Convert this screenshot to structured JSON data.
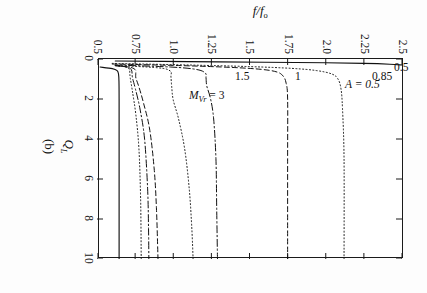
{
  "chart_data": {
    "type": "line",
    "title": "",
    "panel_label": "(b)",
    "xlabel": "Q_L",
    "ylabel": "f/f_o",
    "xlim": [
      0,
      10
    ],
    "ylim": [
      0.5,
      2.5
    ],
    "xticks": [
      0,
      2,
      4,
      6,
      8,
      10
    ],
    "xtick_labels": [
      "0",
      "2",
      "4",
      "6",
      "8",
      "10"
    ],
    "yticks": [
      0.5,
      0.75,
      1.0,
      1.25,
      1.5,
      1.75,
      2.0,
      2.25,
      2.5
    ],
    "ytick_labels": [
      "0.5",
      "0.75",
      "1.0",
      "1.25",
      "1.5",
      "1.75",
      "2.0",
      "2.25",
      "2.5"
    ],
    "grid": false,
    "legend_position": "inline-curve-labels",
    "annotations": [
      {
        "text": "A = 0.5",
        "kind": "parameter",
        "x": 1.0,
        "y": 2.12
      },
      {
        "text": "0.5",
        "kind": "curve-label-corner",
        "x": 0.15,
        "y": 2.44
      },
      {
        "text": "0.85",
        "kind": "curve-label",
        "x": 0.62,
        "y": 2.3
      },
      {
        "text": "1",
        "kind": "curve-label",
        "x": 0.62,
        "y": 1.79
      },
      {
        "text": "1.5",
        "kind": "curve-label",
        "x": 0.62,
        "y": 1.4
      },
      {
        "text": "M_Vr = 3",
        "kind": "curve-label",
        "x": 1.55,
        "y": 1.1
      }
    ],
    "series": [
      {
        "name": "M_Vr = 0.5",
        "label": "0.5",
        "style": "solid",
        "asymptote_y": 2.5,
        "knee_x": 0.28,
        "comment": "rises off scale at top-left corner",
        "points": [
          [
            0.1,
            0.62
          ],
          [
            0.13,
            1.1
          ],
          [
            0.16,
            1.6
          ],
          [
            0.19,
            2.0
          ],
          [
            0.22,
            2.25
          ],
          [
            0.26,
            2.42
          ],
          [
            0.3,
            2.5
          ]
        ]
      },
      {
        "name": "M_Vr = 0.85",
        "label": "0.85",
        "style": "dotted",
        "asymptote_y": 2.12,
        "knee_x": 0.55,
        "points": [
          [
            0.22,
            0.6
          ],
          [
            0.3,
            1.1
          ],
          [
            0.38,
            1.5
          ],
          [
            0.47,
            1.78
          ],
          [
            0.58,
            1.94
          ],
          [
            0.75,
            2.04
          ],
          [
            1.0,
            2.08
          ],
          [
            1.5,
            2.1
          ],
          [
            2.5,
            2.11
          ],
          [
            5.0,
            2.12
          ],
          [
            10.0,
            2.12
          ]
        ]
      },
      {
        "name": "M_Vr = 1",
        "label": "1",
        "style": "dashed",
        "asymptote_y": 1.75,
        "knee_x": 0.5,
        "points": [
          [
            0.25,
            0.6
          ],
          [
            0.33,
            1.05
          ],
          [
            0.42,
            1.38
          ],
          [
            0.52,
            1.58
          ],
          [
            0.65,
            1.68
          ],
          [
            0.85,
            1.72
          ],
          [
            1.2,
            1.74
          ],
          [
            2.0,
            1.75
          ],
          [
            5.0,
            1.75
          ],
          [
            10.0,
            1.75
          ]
        ]
      },
      {
        "name": "M_Vr = 1.5",
        "label": "1.5",
        "style": "dashdot",
        "asymptote_y": 1.29,
        "minimum_y": 1.2,
        "minimum_x": 1.35,
        "knee_x": 0.45,
        "points": [
          [
            0.3,
            0.62
          ],
          [
            0.4,
            0.98
          ],
          [
            0.52,
            1.15
          ],
          [
            0.7,
            1.21
          ],
          [
            0.95,
            1.215
          ],
          [
            1.35,
            1.22
          ],
          [
            2.0,
            1.245
          ],
          [
            3.0,
            1.265
          ],
          [
            5.0,
            1.28
          ],
          [
            7.5,
            1.285
          ],
          [
            10.0,
            1.29
          ]
        ]
      },
      {
        "name": "M_Vr = 2",
        "label": "",
        "style": "dotted",
        "asymptote_y": 1.13,
        "minimum_y": 0.99,
        "minimum_x": 2.05,
        "knee_x": 0.42,
        "points": [
          [
            0.32,
            0.62
          ],
          [
            0.44,
            0.9
          ],
          [
            0.6,
            0.98
          ],
          [
            0.9,
            0.985
          ],
          [
            1.4,
            0.99
          ],
          [
            2.05,
            1.0
          ],
          [
            3.0,
            1.035
          ],
          [
            4.5,
            1.075
          ],
          [
            6.5,
            1.105
          ],
          [
            8.5,
            1.122
          ],
          [
            10.0,
            1.13
          ]
        ]
      },
      {
        "name": "M_Vr = 3",
        "label": "M_Vr = 3",
        "style": "dashed",
        "asymptote_y": 0.9,
        "minimum_y": 0.755,
        "minimum_x": 0.95,
        "knee_x": 0.4,
        "points": [
          [
            0.33,
            0.62
          ],
          [
            0.42,
            0.72
          ],
          [
            0.55,
            0.752
          ],
          [
            0.75,
            0.754
          ],
          [
            0.95,
            0.755
          ],
          [
            1.4,
            0.775
          ],
          [
            2.2,
            0.805
          ],
          [
            3.5,
            0.845
          ],
          [
            5.5,
            0.875
          ],
          [
            7.5,
            0.89
          ],
          [
            10.0,
            0.9
          ]
        ]
      },
      {
        "name": "M_Vr = 4",
        "label": "",
        "style": "dashdot",
        "asymptote_y": 0.84,
        "minimum_y": 0.73,
        "minimum_x": 0.85,
        "knee_x": 0.38,
        "points": [
          [
            0.33,
            0.62
          ],
          [
            0.41,
            0.7
          ],
          [
            0.53,
            0.725
          ],
          [
            0.72,
            0.73
          ],
          [
            0.95,
            0.733
          ],
          [
            1.5,
            0.752
          ],
          [
            2.5,
            0.782
          ],
          [
            4.0,
            0.812
          ],
          [
            6.5,
            0.832
          ],
          [
            8.5,
            0.838
          ],
          [
            10.0,
            0.84
          ]
        ]
      },
      {
        "name": "M_Vr = 6",
        "label": "",
        "style": "dotted",
        "asymptote_y": 0.79,
        "minimum_y": 0.715,
        "minimum_x": 0.8,
        "knee_x": 0.36,
        "points": [
          [
            0.33,
            0.62
          ],
          [
            0.4,
            0.69
          ],
          [
            0.52,
            0.712
          ],
          [
            0.7,
            0.715
          ],
          [
            0.95,
            0.718
          ],
          [
            1.6,
            0.732
          ],
          [
            2.8,
            0.755
          ],
          [
            4.5,
            0.775
          ],
          [
            7.0,
            0.786
          ],
          [
            10.0,
            0.79
          ]
        ]
      },
      {
        "name": "M_Vr = large",
        "label": "",
        "style": "solid",
        "asymptote_y": 0.645,
        "knee_x": 0.52,
        "comment": "outermost solid boundary curve",
        "points": [
          [
            0.4,
            0.52
          ],
          [
            0.48,
            0.6
          ],
          [
            0.58,
            0.632
          ],
          [
            0.75,
            0.641
          ],
          [
            1.1,
            0.644
          ],
          [
            2.0,
            0.645
          ],
          [
            4.0,
            0.645
          ],
          [
            7.0,
            0.645
          ],
          [
            10.0,
            0.645
          ]
        ]
      }
    ]
  }
}
